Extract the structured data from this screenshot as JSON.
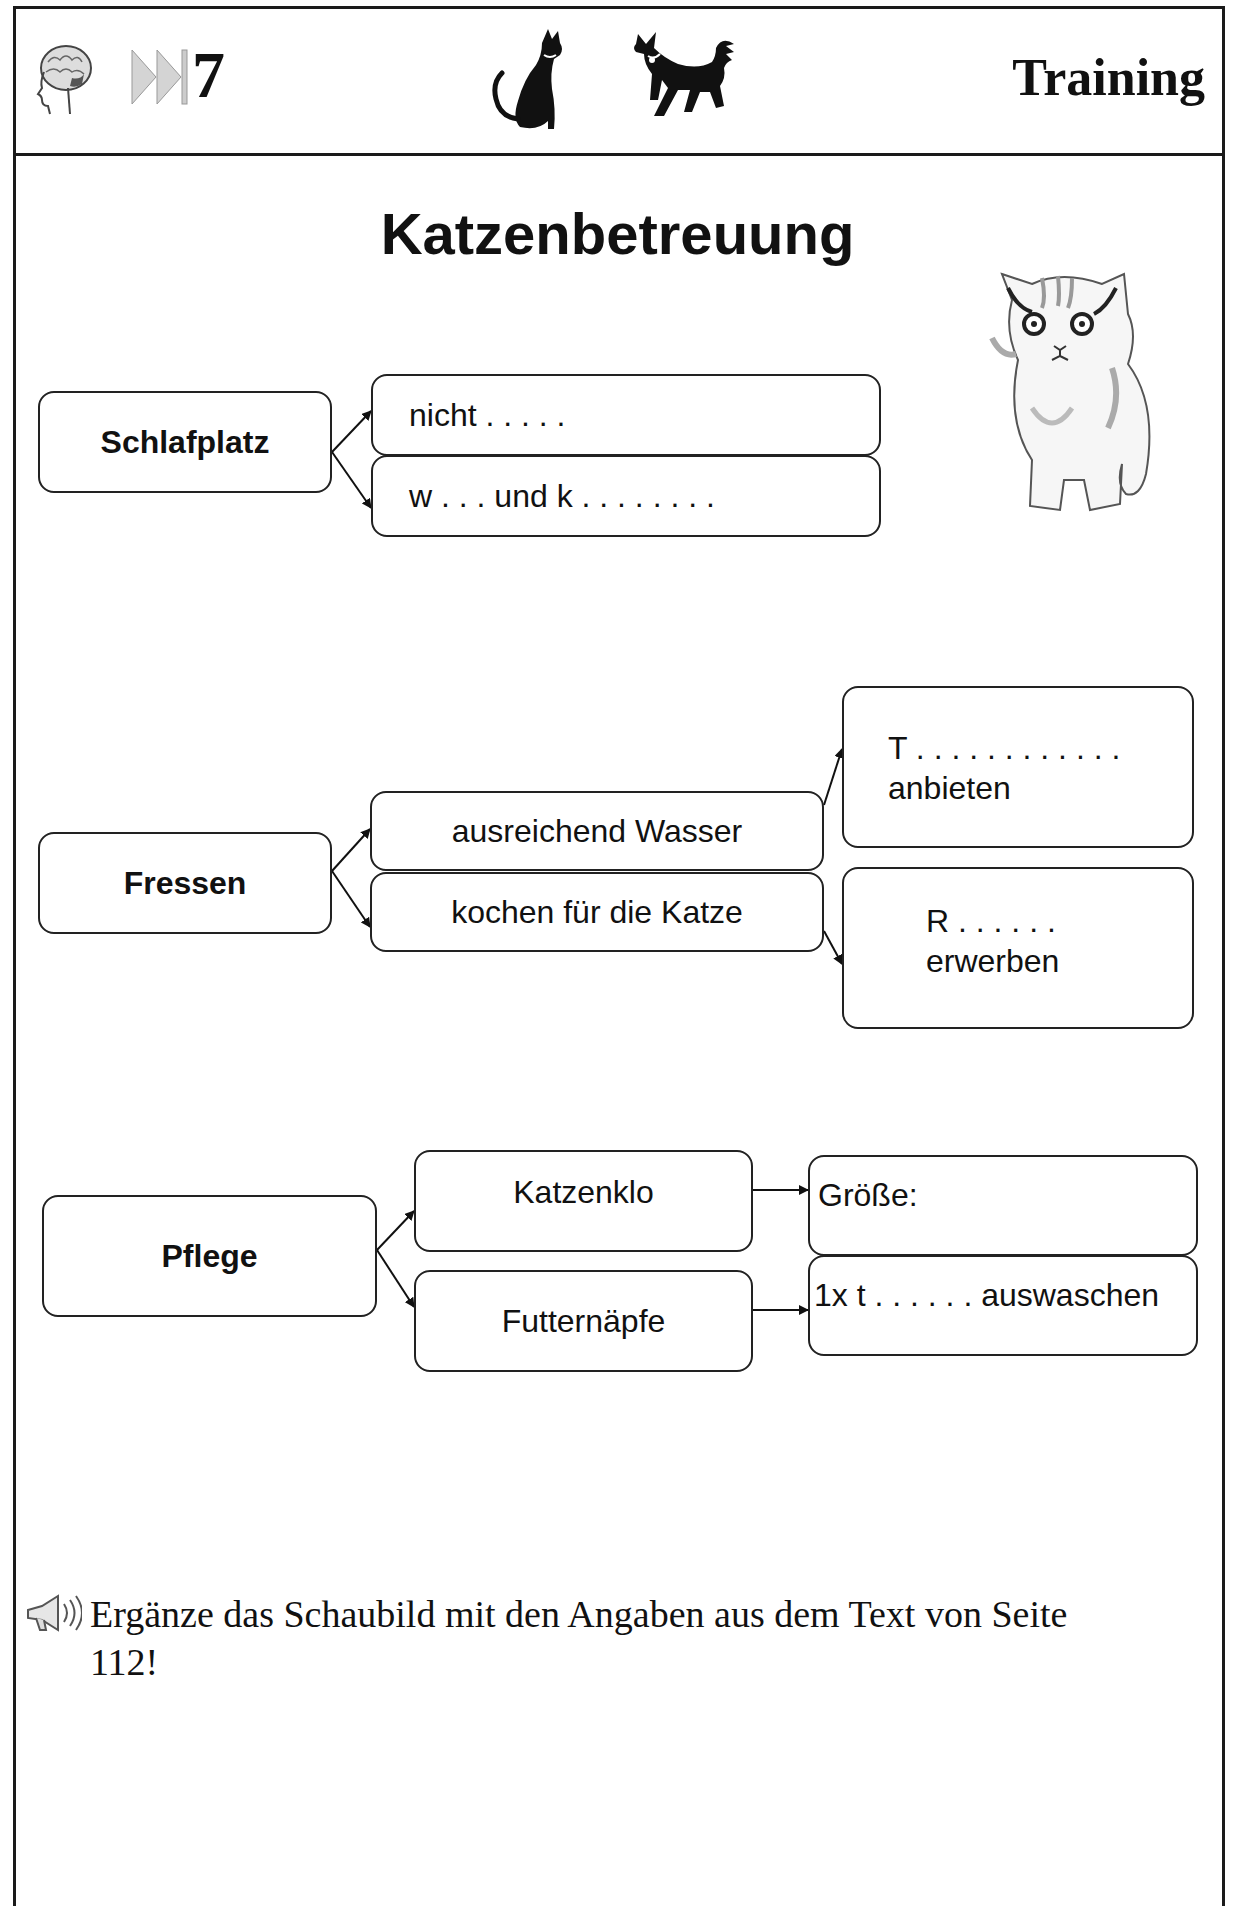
{
  "header": {
    "icons": [
      "brain-head-icon",
      "fast-forward-icon",
      "cat-silhouette-icon",
      "dog-silhouette-icon"
    ],
    "number": "7",
    "label": "Training"
  },
  "title": "Katzenbetreuung",
  "illustration": "kitten-illustration",
  "diagram": {
    "schlafplatz": {
      "label": "Schlafplatz",
      "branches": [
        "nicht . . . . .",
        "w . . . und  k . . . . . . . ."
      ]
    },
    "fressen": {
      "label": "Fressen",
      "branches": [
        "ausreichend Wasser",
        "kochen für die Katze"
      ],
      "sub_branches": [
        {
          "line1": "T . . . . . . . . . . . .",
          "line2": "anbieten"
        },
        {
          "line1": "R  .  .  .  .  .  .",
          "line2": "erwerben"
        }
      ]
    },
    "pflege": {
      "label": "Pflege",
      "branches": [
        "Katzenklo",
        "Futternäpfe"
      ],
      "sub_branches": [
        "Größe:",
        "1x t . . . . . . auswaschen"
      ]
    }
  },
  "instruction": {
    "icon": "megaphone-icon",
    "text": "Ergänze das Schaubild mit den Angaben aus dem Text von Seite 112!"
  }
}
